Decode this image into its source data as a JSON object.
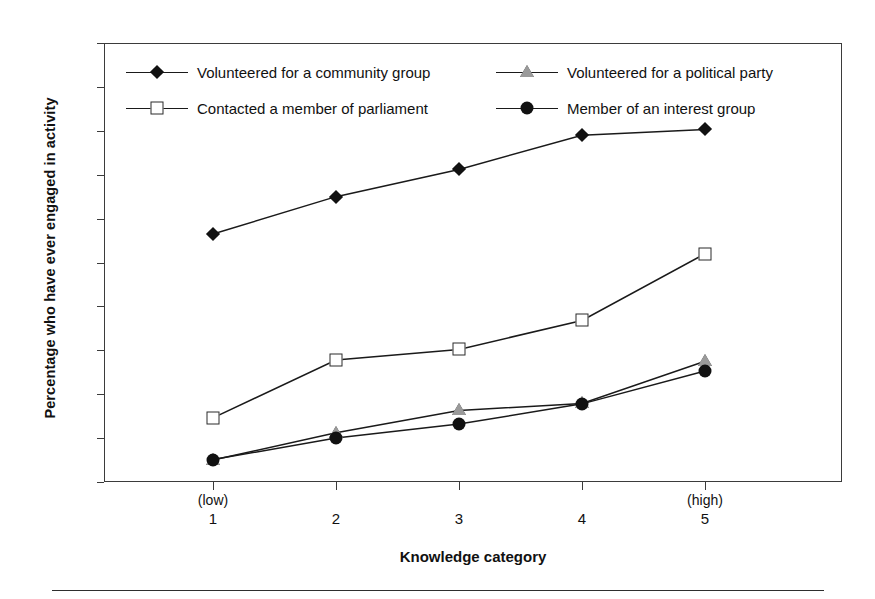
{
  "chart_data": {
    "type": "line",
    "title": "",
    "xlabel": "Knowledge category",
    "ylabel": "Percentage who have ever engaged in activity",
    "categories": [
      "1",
      "2",
      "3",
      "4",
      "5"
    ],
    "category_qualifiers": [
      "(low)",
      "",
      "",
      "",
      "(high)"
    ],
    "ylim": [
      0,
      100
    ],
    "ytick_labels": [
      "0",
      "10",
      "20",
      "30",
      "40",
      "50",
      "60",
      "70",
      "80",
      "90",
      "100"
    ],
    "ytick_values": [
      0,
      10,
      20,
      30,
      40,
      50,
      60,
      70,
      80,
      90,
      100
    ],
    "grid": false,
    "legend_position": "top-inside",
    "series": [
      {
        "name": "Volunteered for a community group",
        "marker": "diamond-filled",
        "color": "#111111",
        "values": [
          56.5,
          65.0,
          71.2,
          79.0,
          80.3
        ]
      },
      {
        "name": "Volunteered for a political party",
        "marker": "triangle-grey",
        "color": "#9a9a9a",
        "values": [
          5.0,
          11.2,
          16.3,
          17.9,
          27.5
        ]
      },
      {
        "name": "Contacted a member of parliament",
        "marker": "square-open",
        "color": "#2b2b2b",
        "values": [
          14.6,
          27.8,
          30.2,
          36.8,
          52.0
        ]
      },
      {
        "name": "Member of an interest group",
        "marker": "circle-filled",
        "color": "#111111",
        "values": [
          5.1,
          10.0,
          13.2,
          17.8,
          25.3
        ]
      }
    ]
  },
  "legend": {
    "entries": [
      {
        "label": "Volunteered for a community group",
        "marker": "diamond-filled"
      },
      {
        "label": "Volunteered for a political party",
        "marker": "triangle-grey"
      },
      {
        "label": "Contacted a member of parliament",
        "marker": "square-open"
      },
      {
        "label": "Member of an interest group",
        "marker": "circle-filled"
      }
    ]
  },
  "colors": {
    "axis": "#3b3b3b",
    "line": "#1a1a1a",
    "marker_fill": "#111111",
    "marker_grey": "#9a9a9a",
    "background": "#ffffff"
  }
}
